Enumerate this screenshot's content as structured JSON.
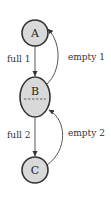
{
  "diagram": {
    "type": "state-transition",
    "nodes": [
      {
        "id": "A",
        "label": "A",
        "shape": "circle"
      },
      {
        "id": "B",
        "label": "B",
        "shape": "ellipse",
        "has_dashed_divider": true
      },
      {
        "id": "C",
        "label": "C",
        "shape": "circle"
      }
    ],
    "edges": [
      {
        "from": "A",
        "to": "B",
        "label": "full 1",
        "style": "straight"
      },
      {
        "from": "B",
        "to": "A",
        "label": "empty 1",
        "style": "curved"
      },
      {
        "from": "B",
        "to": "C",
        "label": "full 2",
        "style": "straight"
      },
      {
        "from": "C",
        "to": "B",
        "label": "empty 2",
        "style": "curved"
      }
    ],
    "colors": {
      "node_fill": "#d9d9d9",
      "node_stroke": "#333333",
      "edge": "#444444",
      "background": "#ffffff"
    }
  }
}
